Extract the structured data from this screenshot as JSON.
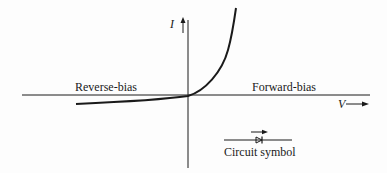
{
  "diagram": {
    "axes": {
      "y_label": "I",
      "x_label": "V"
    },
    "regions": {
      "left_label": "Reverse-bias",
      "right_label": "Forward-bias"
    },
    "symbol": {
      "caption": "Circuit symbol",
      "icon": "diode-icon"
    },
    "colors": {
      "ink": "#1a1a1a",
      "background": "#fdfdfd"
    }
  }
}
